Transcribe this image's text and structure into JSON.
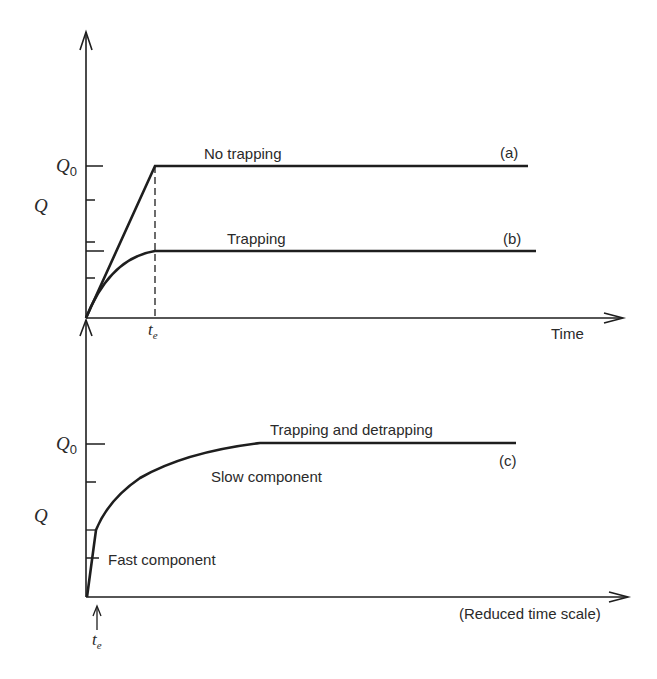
{
  "colors": {
    "ink": "#1e1e1e",
    "text": "#2a2a2a",
    "background": "#ffffff"
  },
  "top_chart": {
    "y_axis_label": "Q",
    "y_level_label": "Q",
    "y_level_subscript": "0",
    "x_axis_label": "Time",
    "x_marker_label": "t",
    "x_marker_subscript": "e",
    "curves": [
      {
        "id": "a",
        "label": "No trapping",
        "tag": "(a)"
      },
      {
        "id": "b",
        "label": "Trapping",
        "tag": "(b)"
      }
    ]
  },
  "bottom_chart": {
    "y_axis_label": "Q",
    "y_level_label": "Q",
    "y_level_subscript": "0",
    "x_axis_label": "(Reduced time scale)",
    "x_marker_label": "t",
    "x_marker_subscript": "e",
    "curve": {
      "id": "c",
      "label": "Trapping and detrapping",
      "tag": "(c)"
    },
    "annotations": {
      "slow": "Slow component",
      "fast": "Fast component"
    }
  }
}
